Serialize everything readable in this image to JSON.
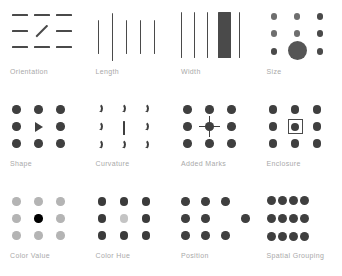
{
  "figure": {
    "background_color": "#ffffff",
    "label_color": "#a9a9a9",
    "mark_color": "#4a4a4a"
  },
  "panels": [
    {
      "id": "orientation",
      "label": "Orientation",
      "description": "Nine short dashes in a 3x3 grid; the center dash is rotated to a diagonal.",
      "odd_one_out": "center diagonal dash"
    },
    {
      "id": "length",
      "label": "Length",
      "description": "Five vertical lines; the second line from the left is noticeably longer.",
      "odd_one_out": "second line is longer"
    },
    {
      "id": "width",
      "label": "Width",
      "description": "Five vertical lines; the fourth line is a thick wide bar.",
      "odd_one_out": "fourth line is much wider"
    },
    {
      "id": "size",
      "label": "Size",
      "description": "Nine dots in a 3x3 grid; the bottom center dot is much larger.",
      "odd_one_out": "bottom center dot is larger"
    },
    {
      "id": "shape",
      "label": "Shape",
      "description": "Nine marks in a 3x3 grid; the center mark is a triangle instead of a circle.",
      "odd_one_out": "center is a triangle"
    },
    {
      "id": "curvature",
      "label": "Curvature",
      "description": "Nine curved arcs in a 3x3 grid; the center mark is a straight vertical line.",
      "odd_one_out": "center is straight, not curved"
    },
    {
      "id": "added-marks",
      "label": "Added Marks",
      "description": "Nine dots in a 3x3 grid; the center dot carries an added four-pointed star mark.",
      "odd_one_out": "center dot has an added star mark"
    },
    {
      "id": "enclosure",
      "label": "Enclosure",
      "description": "Nine dots in a 3x3 grid; the center dot is enclosed by a square outline.",
      "odd_one_out": "center dot is enclosed in a square"
    },
    {
      "id": "color-value",
      "label": "Color Value",
      "description": "Nine dots in a 3x3 grid drawn in light gray; the center dot is solid black.",
      "odd_one_out": "center dot is darker in value"
    },
    {
      "id": "color-hue",
      "label": "Color Hue",
      "description": "Nine dots in a 3x3 grid drawn in dark gray; the center dot is a lighter contrasting hue.",
      "odd_one_out": "center dot has a different hue"
    },
    {
      "id": "position",
      "label": "Position",
      "description": "Nine dots in a 3x3 grid; the middle row right dot is shifted outward to the right.",
      "odd_one_out": "middle right dot is displaced"
    },
    {
      "id": "spatial-grouping",
      "label": "Spatial Grouping",
      "description": "Twelve dots arranged as three tight horizontal rows of four, grouped by spacing.",
      "odd_one_out": "dots cluster into three grouped rows"
    }
  ],
  "marks": {
    "orientation": {
      "rows_y": [
        14,
        30,
        46
      ],
      "cols_x": [
        12,
        34,
        56
      ],
      "dash_width": 16,
      "rotated_index": 4,
      "rotated_angle_deg": -45
    },
    "length": {
      "lines_x": [
        12,
        26,
        40,
        54,
        68
      ],
      "heights": [
        34,
        48,
        34,
        34,
        34
      ],
      "top_y": [
        20,
        13,
        20,
        20,
        20
      ],
      "widths": [
        1.4,
        1.4,
        1.4,
        1.4,
        1.4
      ]
    },
    "width": {
      "lines_x": [
        10,
        23,
        36,
        47,
        68
      ],
      "widths": [
        1.4,
        1.4,
        1.4,
        13,
        1.4
      ],
      "height": 46,
      "top_y": 12
    },
    "size": {
      "rows_y": [
        16,
        32,
        49
      ],
      "cols_x": [
        14,
        37,
        60
      ],
      "small_d": 6.5,
      "large_index": 7,
      "large_d": 19
    },
    "grid": {
      "rows_y": [
        16,
        33,
        50
      ],
      "cols_x": [
        14,
        36,
        58
      ],
      "dot_d": 8.5
    },
    "position": {
      "displaced_index": 5,
      "displaced_x": 72
    },
    "spatial_grouping": {
      "rows_y": [
        15,
        33,
        51
      ],
      "cols_x": [
        10,
        21,
        32,
        43
      ],
      "dot_d": 9
    }
  },
  "colors": {
    "dark": "#4a4a4a",
    "mid": "#3f3f3f",
    "value_light": "#b4b4b4",
    "value_accent": "#000000",
    "hue_base": "#3b3b3b",
    "hue_accent": "#c4c4c4",
    "size_small": "#6e6e6e",
    "size_large": "#555555"
  }
}
